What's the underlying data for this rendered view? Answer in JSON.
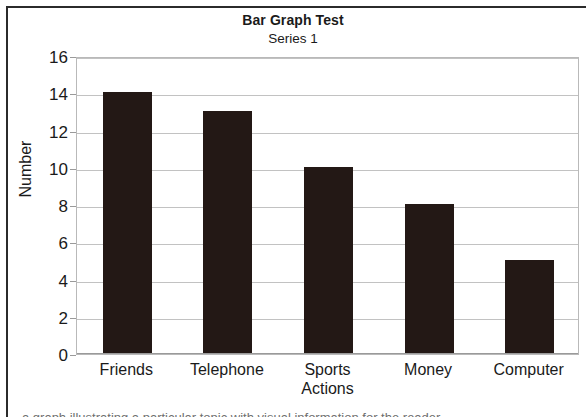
{
  "chart_data": {
    "type": "bar",
    "title": "Bar Graph Test",
    "subtitle": "Series 1",
    "categories": [
      "Friends",
      "Telephone",
      "Sports Actions",
      "Money",
      "Computer"
    ],
    "category_lines": [
      [
        "Friends"
      ],
      [
        "Telephone"
      ],
      [
        "Sports",
        "Actions"
      ],
      [
        "Money"
      ],
      [
        "Computer"
      ]
    ],
    "values": [
      14,
      13,
      10,
      8,
      5
    ],
    "series": [
      {
        "name": "Series 1",
        "values": [
          14,
          13,
          10,
          8,
          5
        ]
      }
    ],
    "xlabel": "",
    "ylabel": "Number",
    "ylim": [
      0,
      16
    ],
    "ytick_step": 2,
    "ytick_labels": [
      "16",
      "14",
      "12",
      "10",
      "8",
      "6",
      "4",
      "2",
      "0"
    ],
    "grid": true,
    "legend": false,
    "bar_color": "#231815",
    "gridline_color": "#c2c2c2",
    "plot_border_color": "#b9b9b9"
  },
  "page": {
    "cutoff_text": "a graph illustrating a particular topic with visual information for the reader"
  }
}
